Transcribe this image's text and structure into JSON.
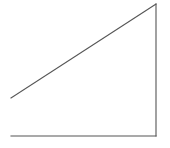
{
  "diagram": {
    "type": "open-right-triangle",
    "stroke_color": "#555555",
    "stroke_width": 1.1,
    "background": "#ffffff",
    "lines": [
      {
        "name": "hypotenuse",
        "x1": 11,
        "y1": 98,
        "x2": 156,
        "y2": 4
      },
      {
        "name": "vertical-side",
        "x1": 156,
        "y1": 4,
        "x2": 156,
        "y2": 136
      },
      {
        "name": "base",
        "x1": 11,
        "y1": 136,
        "x2": 156,
        "y2": 136
      }
    ]
  }
}
